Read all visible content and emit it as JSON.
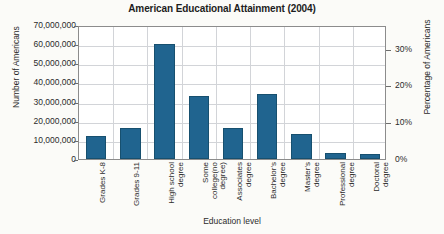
{
  "chart_data": {
    "type": "bar",
    "title": "American Educational Attainment (2004)",
    "xlabel": "Education level",
    "ylabel": "Number of Americans",
    "y2label": "Percentage of Americans",
    "categories": [
      "Grades K-8",
      "Grades 9-11",
      "High school degree",
      "Some college(no degree)",
      "Associates degree",
      "Bachelor's degree",
      "Master's degree",
      "Professional degree",
      "Doctoral degree"
    ],
    "values": [
      12000000,
      16000000,
      60000000,
      33000000,
      16000000,
      34000000,
      13000000,
      3000000,
      2500000
    ],
    "ylim": [
      0,
      70000000
    ],
    "yticks": [
      "0",
      "10,000,000",
      "20,000,000",
      "30,000,000",
      "40,000,000",
      "50,000,000",
      "60,000,000",
      "70,000,000"
    ],
    "y2lim": [
      0,
      36.4
    ],
    "y2ticks": [
      "0%",
      "10%",
      "20%",
      "30%"
    ],
    "y2tick_values": [
      0,
      10,
      20,
      30
    ],
    "grid": true,
    "legend": "none",
    "bar_color": "#20648f",
    "bar_edge_color": "#17506f",
    "grid_color": "#d2d4d8",
    "axis_color": "#8c8c8c",
    "background": "#fbfbf8"
  }
}
